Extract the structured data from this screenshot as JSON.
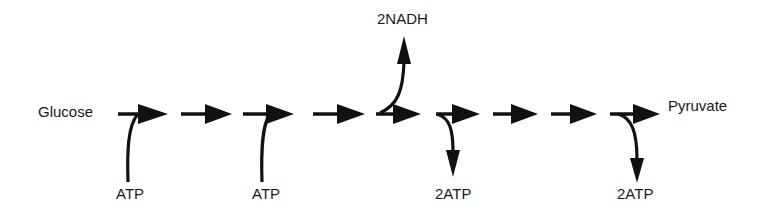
{
  "diagram": {
    "colors": {
      "stroke": "#111111",
      "text": "#1a1a1a",
      "background": "#ffffff"
    },
    "start_label": "Glucose",
    "end_label": "Pyruvate",
    "steps": [
      {
        "index": 1,
        "input": "ATP"
      },
      {
        "index": 2
      },
      {
        "index": 3,
        "input": "ATP"
      },
      {
        "index": 4
      },
      {
        "index": 5,
        "output_up": "2NADH"
      },
      {
        "index": 6,
        "output_down": "2ATP"
      },
      {
        "index": 7
      },
      {
        "index": 8
      },
      {
        "index": 9,
        "output_down": "2ATP"
      }
    ],
    "labels": {
      "glucose": "Glucose",
      "pyruvate": "Pyruvate",
      "atp_in_1": "ATP",
      "atp_in_2": "ATP",
      "nadh_out": "2NADH",
      "atp_out_1": "2ATP",
      "atp_out_2": "2ATP"
    }
  }
}
